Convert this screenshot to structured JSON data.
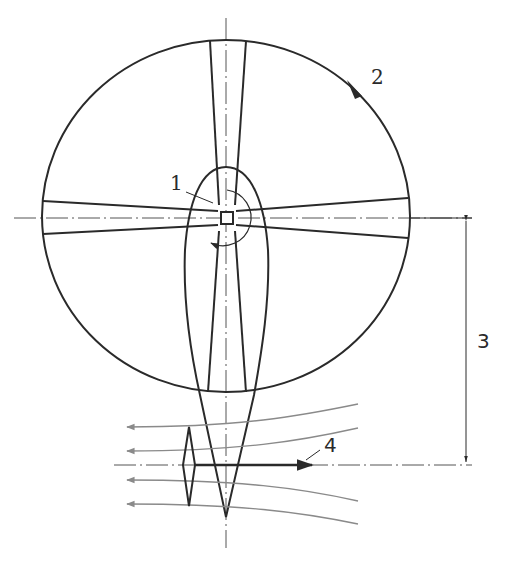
{
  "diagram": {
    "type": "helicopter-rotor-schematic-top-view",
    "labels": {
      "l1": "1",
      "l2": "2",
      "l3": "3",
      "l4": "4"
    },
    "label_meanings": {
      "1": "main rotor reaction torque (curved arrow around hub)",
      "2": "main rotor rotation direction",
      "3": "moment arm distance (rotor hub to tail rotor axis)",
      "4": "tail rotor thrust"
    },
    "colors": {
      "stroke": "#2a2a2a",
      "centerline": "#555555",
      "airflow": "#8a8a8a",
      "background": "#ffffff"
    },
    "rotor_disc": {
      "cx": 226,
      "cy": 216,
      "rx": 184,
      "ry": 176
    },
    "hub": {
      "cx": 227,
      "cy": 218,
      "size": 12
    },
    "tail_rotor_axis_y": 465,
    "airflow_arrows": 4
  }
}
